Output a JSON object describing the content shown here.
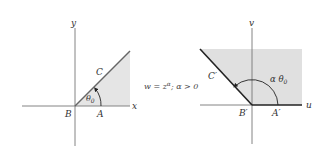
{
  "left_plane": {
    "axis_x_label": "x",
    "axis_y_label": "y",
    "point_origin": "B",
    "point_on_x": "A",
    "point_on_ray": "C",
    "angle_label": "θ",
    "angle_subscript": "0"
  },
  "mapping": {
    "lhs": "w = z",
    "exponent": "α",
    "condition": "; α > 0"
  },
  "right_plane": {
    "axis_u_label": "u",
    "axis_v_label": "v",
    "point_origin": "B′",
    "point_on_u": "A′",
    "point_on_ray": "C′",
    "angle_label": "α θ",
    "angle_subscript": "0"
  },
  "colors": {
    "shade": "#e3e3e3",
    "axis": "#666666",
    "boundary": "#222222"
  }
}
